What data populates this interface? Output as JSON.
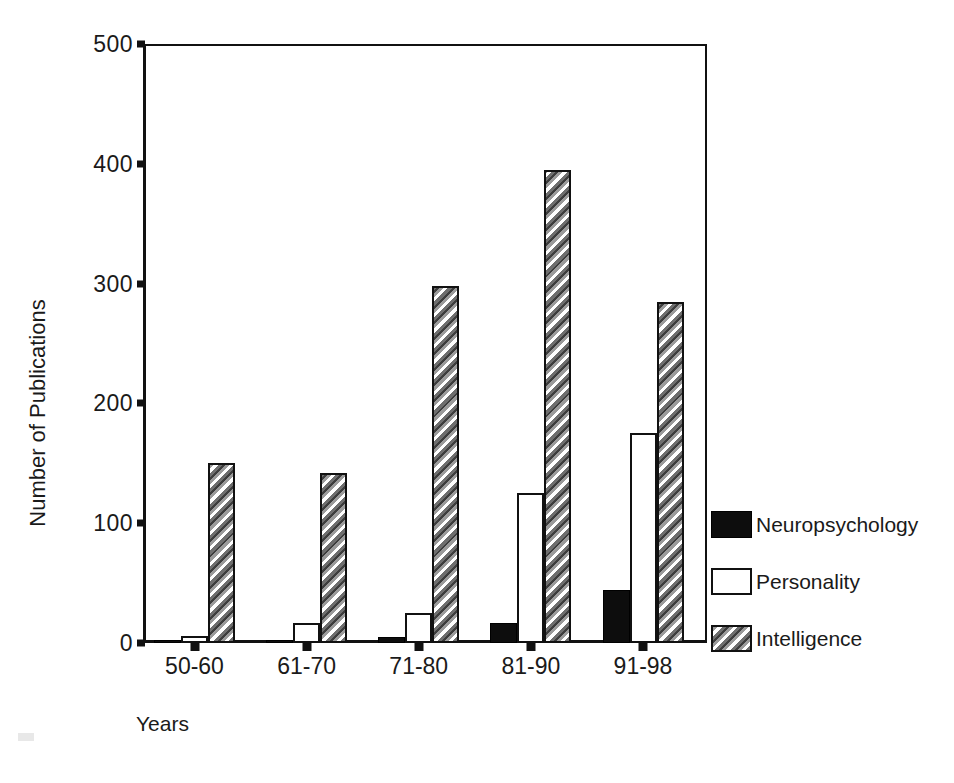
{
  "chart_data": {
    "type": "bar",
    "title": "",
    "xlabel": "Years",
    "ylabel": "Number of Publications",
    "categories": [
      "50-60",
      "61-70",
      "71-80",
      "81-90",
      "91-98"
    ],
    "series": [
      {
        "name": "Neuropsychology",
        "style": "solid-black",
        "values": [
          1,
          2,
          5,
          17,
          44
        ]
      },
      {
        "name": "Personality",
        "style": "white-outline",
        "values": [
          6,
          17,
          25,
          125,
          175
        ]
      },
      {
        "name": "Intelligence",
        "style": "hatched-gray",
        "values": [
          150,
          142,
          298,
          395,
          285
        ]
      }
    ],
    "yticks": [
      0,
      100,
      200,
      300,
      400,
      500
    ],
    "ylim": [
      0,
      500
    ],
    "grid": false,
    "legend_position": "right"
  },
  "legend": {
    "items": [
      {
        "label": "Neuropsychology",
        "style": "neuro"
      },
      {
        "label": "Personality",
        "style": "personality"
      },
      {
        "label": "Intelligence",
        "style": "intelligence"
      }
    ]
  },
  "colors": {
    "axis": "#111111",
    "neuropsychology": "#0d0d0d",
    "personality": "#ffffff",
    "intelligence": "#8e8e8e",
    "background": "#ffffff"
  }
}
